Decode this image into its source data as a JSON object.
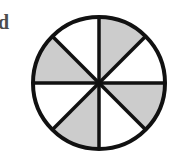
{
  "figure": {
    "label": "d",
    "type": "fraction-circle",
    "total_sectors": 8,
    "shaded_sectors": 4,
    "unshaded_sectors": 4,
    "fraction_shaded": "4/8",
    "sector_angle_degrees": 45,
    "sector_pattern": [
      "shaded",
      "unshaded",
      "shaded",
      "unshaded",
      "shaded",
      "unshaded",
      "shaded",
      "unshaded"
    ],
    "sectors": [
      {
        "index": 1,
        "start_deg": 0,
        "end_deg": 45,
        "state": "shaded"
      },
      {
        "index": 2,
        "start_deg": 45,
        "end_deg": 90,
        "state": "unshaded"
      },
      {
        "index": 3,
        "start_deg": 90,
        "end_deg": 135,
        "state": "shaded"
      },
      {
        "index": 4,
        "start_deg": 135,
        "end_deg": 180,
        "state": "unshaded"
      },
      {
        "index": 5,
        "start_deg": 180,
        "end_deg": 225,
        "state": "shaded"
      },
      {
        "index": 6,
        "start_deg": 225,
        "end_deg": 270,
        "state": "unshaded"
      },
      {
        "index": 7,
        "start_deg": 270,
        "end_deg": 315,
        "state": "shaded"
      },
      {
        "index": 8,
        "start_deg": 315,
        "end_deg": 360,
        "state": "unshaded"
      }
    ],
    "geometry": {
      "center_x": 71,
      "center_y": 70,
      "radius": 66,
      "outline_width": 4,
      "divider_width": 3.5
    },
    "colors": {
      "shaded_fill": "#cccccc",
      "unshaded_fill": "#ffffff",
      "outline": "#111111",
      "divider": "#111111",
      "label_text": "#4d4d4d",
      "background": "#ffffff"
    }
  }
}
